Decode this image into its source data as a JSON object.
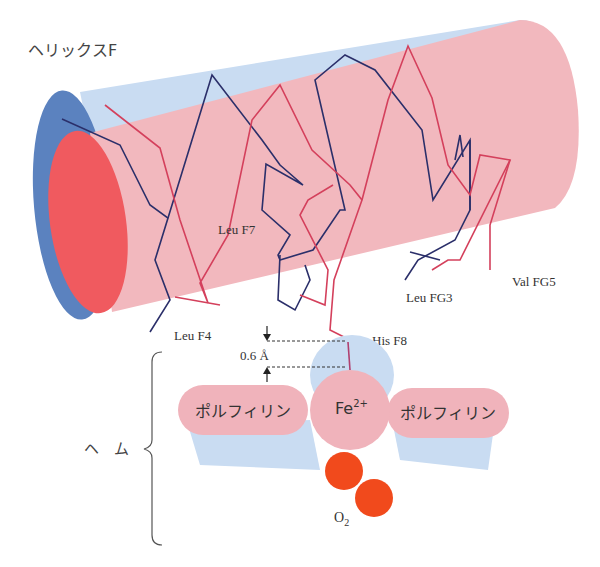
{
  "labels": {
    "helix": "ヘリックスF",
    "leu_f7": "Leu F7",
    "leu_f4": "Leu F4",
    "leu_fg3": "Leu FG3",
    "val_fg5": "Val FG5",
    "his_f8": "His F8",
    "distance": "0.6 Å",
    "porphyrin_left": "ポルフィリン",
    "porphyrin_right": "ポルフィリン",
    "fe": "Fe",
    "fe_charge": "2+",
    "heme": "ヘ　ム",
    "o2": "O",
    "o2_sub": "2"
  },
  "colors": {
    "helix_body": "#f2b8be",
    "helix_back": "#c9dcf2",
    "helix_cap_front": "#f05a5f",
    "helix_cap_back": "#5b82bf",
    "chain_dark": "#2b2f6a",
    "chain_red": "#d4405c",
    "porphyrin": "#f0b3bb",
    "heme_shadow": "#c9dcf2",
    "oxygen": "#f14a1c",
    "text": "#333333"
  }
}
